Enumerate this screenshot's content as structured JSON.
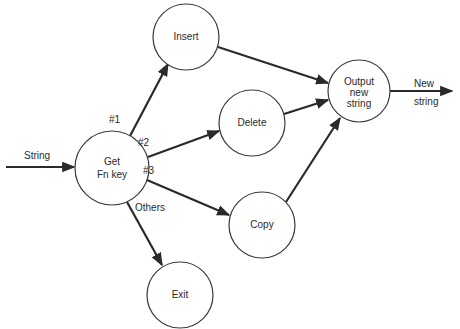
{
  "diagram": {
    "type": "flowchart",
    "nodes": {
      "getfn": {
        "line1": "Get",
        "line2": "Fn key"
      },
      "insert": {
        "label": "Insert"
      },
      "delete": {
        "label": "Delete"
      },
      "copy": {
        "label": "Copy"
      },
      "exit": {
        "label": "Exit"
      },
      "output": {
        "line1": "Output",
        "line2": "new",
        "line3": "string"
      }
    },
    "edges": {
      "input": {
        "label": "String"
      },
      "to_insert": {
        "label": "#1"
      },
      "to_delete": {
        "label": "#2"
      },
      "to_copy": {
        "label": "#3"
      },
      "to_exit": {
        "label": "Others"
      },
      "output": {
        "line1": "New",
        "line2": "string"
      }
    }
  }
}
